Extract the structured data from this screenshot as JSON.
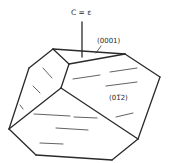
{
  "diagram": {
    "labels": {
      "axis": "C = ε",
      "top_face": "(0001)",
      "side_face": "(01̅2)"
    },
    "side_face_parts": {
      "open": "(0",
      "one": "1",
      "one_bar": "1",
      "close": "2)"
    },
    "colors": {
      "line": "#2a2a2a",
      "background": "#ffffff"
    }
  }
}
